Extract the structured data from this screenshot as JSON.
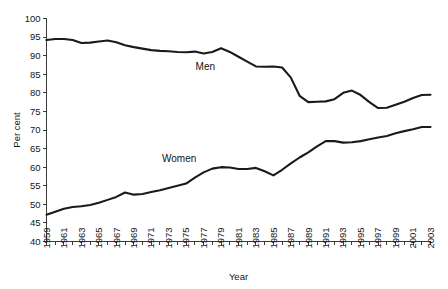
{
  "chart_data": {
    "type": "line",
    "title": "",
    "xlabel": "Year",
    "ylabel": "Per cent",
    "ylim": [
      40,
      100
    ],
    "xlim": [
      1959,
      2003
    ],
    "ytick_step": 5,
    "yticks": [
      40,
      45,
      50,
      55,
      60,
      65,
      70,
      75,
      80,
      85,
      90,
      95,
      100
    ],
    "xticks_all": [
      1959,
      1960,
      1961,
      1962,
      1963,
      1964,
      1965,
      1966,
      1967,
      1968,
      1969,
      1970,
      1971,
      1972,
      1973,
      1974,
      1975,
      1976,
      1977,
      1978,
      1979,
      1980,
      1981,
      1982,
      1983,
      1984,
      1985,
      1986,
      1987,
      1988,
      1989,
      1990,
      1991,
      1992,
      1993,
      1994,
      1995,
      1996,
      1997,
      1998,
      1999,
      2000,
      2001,
      2002,
      2003
    ],
    "xtick_labels": [
      "1959",
      "1961",
      "1963",
      "1965",
      "1967",
      "1969",
      "1971",
      "1973",
      "1975",
      "1977",
      "1979",
      "1981",
      "1983",
      "1985",
      "1987",
      "1989",
      "1991",
      "1993",
      "1995",
      "1997",
      "1999",
      "2001",
      "2003"
    ],
    "grid": false,
    "legend_position": "inline-annotation",
    "line_color": "#1a1a1a",
    "x": [
      1959,
      1960,
      1961,
      1962,
      1963,
      1964,
      1965,
      1966,
      1967,
      1968,
      1969,
      1970,
      1971,
      1972,
      1973,
      1974,
      1975,
      1976,
      1977,
      1978,
      1979,
      1980,
      1981,
      1982,
      1983,
      1984,
      1985,
      1986,
      1987,
      1988,
      1989,
      1990,
      1991,
      1992,
      1993,
      1994,
      1995,
      1996,
      1997,
      1998,
      1999,
      2000,
      2001,
      2002,
      2003
    ],
    "series": [
      {
        "name": "Men",
        "label": "Men",
        "label_x": 1977.2,
        "label_y": 86.2,
        "values": [
          94.2,
          94.5,
          94.5,
          94.2,
          93.4,
          93.5,
          93.8,
          94.1,
          93.6,
          92.8,
          92.3,
          91.9,
          91.5,
          91.3,
          91.2,
          91.0,
          90.9,
          91.1,
          90.6,
          91.0,
          92.0,
          91.0,
          89.7,
          88.4,
          87.1,
          87.0,
          87.1,
          86.8,
          84.1,
          79.2,
          77.5,
          77.6,
          77.7,
          78.3,
          80.0,
          80.6,
          79.4,
          77.5,
          75.9,
          76.0,
          76.8,
          77.6,
          78.6,
          79.4,
          79.5
        ]
      },
      {
        "name": "Women",
        "label": "Women",
        "label_x": 1974.2,
        "label_y": 61.3,
        "values": [
          47.2,
          48.0,
          48.8,
          49.3,
          49.5,
          49.8,
          50.4,
          51.2,
          52.0,
          53.2,
          52.6,
          52.8,
          53.3,
          53.8,
          54.4,
          55.0,
          55.6,
          57.2,
          58.6,
          59.6,
          60.0,
          59.9,
          59.5,
          59.5,
          59.8,
          58.9,
          57.8,
          59.3,
          61.0,
          62.6,
          64.0,
          65.6,
          67.0,
          67.0,
          66.6,
          66.7,
          67.0,
          67.5,
          68.0,
          68.4,
          69.1,
          69.7,
          70.2,
          70.8,
          70.8
        ]
      }
    ]
  }
}
